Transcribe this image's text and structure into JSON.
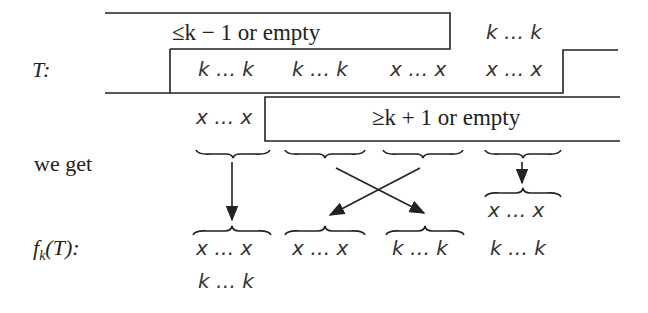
{
  "row_labels": {
    "T": "T:",
    "we_get": "we get",
    "fkT_f": "f",
    "fkT_sub": "k",
    "fkT_rest": "(T):"
  },
  "boxes": {
    "upper_box_label": "≤k − 1 or empty",
    "lower_box_label": "≥k + 1 or empty"
  },
  "T_row": {
    "above_right": "k … k",
    "cells": [
      "k … k",
      "k … k",
      "x … x",
      "x … x"
    ],
    "below_left": "x … x"
  },
  "result_row": {
    "extra_above_4": "x … x",
    "cells": [
      "x … x",
      "x … x",
      "k … k",
      "k … k"
    ],
    "below_1": "k … k"
  },
  "mapping": [
    {
      "from": 1,
      "to": 1,
      "type": "straight"
    },
    {
      "from": 2,
      "to": 3,
      "type": "cross"
    },
    {
      "from": 3,
      "to": 2,
      "type": "cross"
    },
    {
      "from": 4,
      "to": 4,
      "type": "straight"
    }
  ],
  "colors": {
    "ink": "#222222",
    "background": "#ffffff"
  }
}
